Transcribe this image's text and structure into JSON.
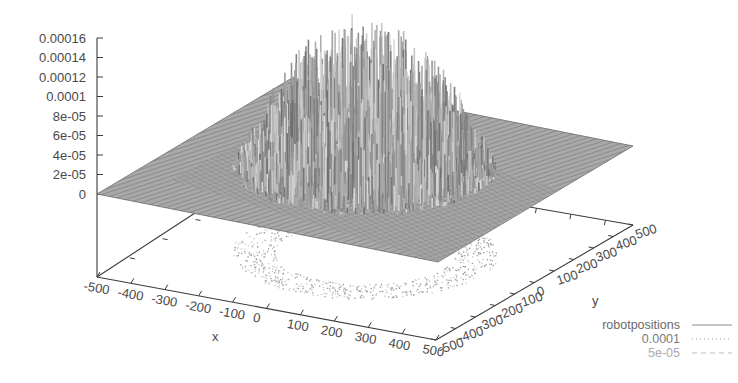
{
  "chart_data": {
    "type": "surface3d",
    "title": "",
    "xlabel": "x",
    "ylabel": "y",
    "zlabel": "",
    "x_ticks": [
      "-500",
      "-400",
      "-300",
      "-200",
      "-100",
      "0",
      "100",
      "200",
      "300",
      "400",
      "500"
    ],
    "y_ticks": [
      "-500",
      "-400",
      "-300",
      "-200",
      "-100",
      "0",
      "100",
      "200",
      "300",
      "400",
      "500"
    ],
    "z_ticks": [
      "0",
      "2e-05",
      "4e-05",
      "6e-05",
      "8e-05",
      "0.0001",
      "0.00012",
      "0.00014",
      "0.00016"
    ],
    "xlim": [
      -500,
      500
    ],
    "ylim": [
      -500,
      500
    ],
    "zlim": [
      0,
      0.00016
    ],
    "grid": false,
    "legend_position": "bottom-right",
    "series": [
      {
        "name": "robotpositions",
        "style": "solid",
        "description": "noisy surface of robot position density, peaked near center (max approx 0.00016), flat 0 near edges"
      },
      {
        "name": "0.0001",
        "style": "dotted",
        "description": "contour at z=0.0001 projected on base"
      },
      {
        "name": "5e-05",
        "style": "dashed",
        "description": "contour at z=5e-05 projected on base"
      }
    ],
    "peak_z_approx": 0.00016,
    "surface_extent_note": "nonzero region roughly within radius ~300 of origin"
  },
  "legend": {
    "items": [
      {
        "label": "robotpositions"
      },
      {
        "label": "0.0001"
      },
      {
        "label": "5e-05"
      }
    ]
  },
  "axes": {
    "x_label": "x",
    "y_label": "y"
  },
  "colors": {
    "axis": "#3a3a3a",
    "surface_dark": "#5a5a5a",
    "surface_light": "#bdbdbd",
    "text": "#4a4a4a",
    "legend_faint": "#9a9a9a"
  }
}
